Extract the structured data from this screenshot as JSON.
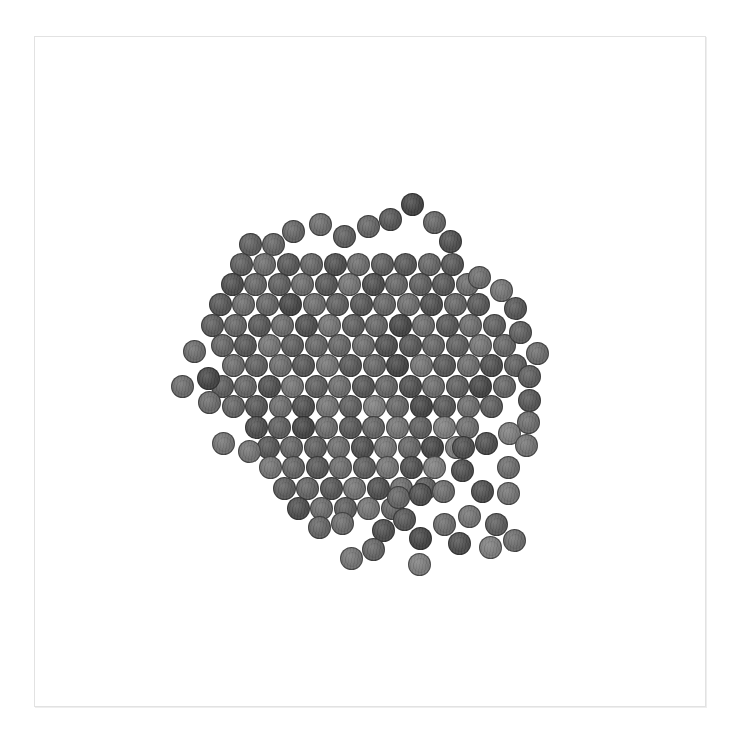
{
  "image": {
    "description": "Overhead grayscale photo of a pile of pennies arranged in a roughly hexagonal close-packed cluster with one empty spot near the center, scattered loose coins around the lower-right edge, on a white background inside a thin light-gray frame",
    "background_color": "#ffffff",
    "frame_color": "#e2e2e2"
  },
  "coin": {
    "diameter": 23,
    "spacing_x": 23.5,
    "spacing_y": 20.4
  },
  "palette": [
    "#3a3a3a",
    "#444444",
    "#4d4d4d",
    "#555555",
    "#5c5c5c",
    "#636363",
    "#6a6a6a",
    "#727272",
    "#7b7b7b",
    "#858585"
  ],
  "rows": [
    {
      "y": 244,
      "x0": 250,
      "n": 2,
      "shades": "45"
    },
    {
      "y": 264,
      "x0": 241,
      "n": 10,
      "shades": "4635264353"
    },
    {
      "y": 284,
      "x0": 232,
      "n": 11,
      "shades": "25463725436"
    },
    {
      "y": 304,
      "x0": 220,
      "n": 12,
      "shades": "365164356253"
    },
    {
      "y": 325,
      "x0": 212,
      "n": 13,
      "shades": "4536274516364"
    },
    {
      "y": 345,
      "x0": 222,
      "n": 13,
      "shades": "5374556235475"
    },
    {
      "y": 365,
      "x0": 233,
      "n": 13,
      "shades": "6463735173624"
    },
    {
      "y": 386,
      "x0": 222,
      "n": 13,
      "shades": "4527463526415"
    },
    {
      "y": 406,
      "x0": 233,
      "n": 12,
      "shades": "536274851364"
    },
    {
      "y": 427,
      "x0": 256,
      "n": 10,
      "shades": "2416357486"
    },
    {
      "y": 447,
      "x0": 268,
      "n": 9,
      "shades": "354627518"
    },
    {
      "y": 467,
      "x0": 270,
      "n": 8,
      "shades": "75364728"
    },
    {
      "y": 488,
      "x0": 284,
      "n": 7,
      "shades": "4537264"
    },
    {
      "y": 508,
      "x0": 298,
      "n": 5,
      "shades": "26475"
    }
  ],
  "hole": {
    "x": 350,
    "y": 356
  },
  "loose_coins": [
    {
      "x": 412,
      "y": 204,
      "s": 1
    },
    {
      "x": 293,
      "y": 231,
      "s": 5
    },
    {
      "x": 320,
      "y": 224,
      "s": 6
    },
    {
      "x": 344,
      "y": 236,
      "s": 4
    },
    {
      "x": 368,
      "y": 226,
      "s": 5
    },
    {
      "x": 390,
      "y": 219,
      "s": 3
    },
    {
      "x": 434,
      "y": 222,
      "s": 5
    },
    {
      "x": 450,
      "y": 241,
      "s": 2
    },
    {
      "x": 479,
      "y": 277,
      "s": 6
    },
    {
      "x": 501,
      "y": 290,
      "s": 7
    },
    {
      "x": 515,
      "y": 308,
      "s": 3
    },
    {
      "x": 520,
      "y": 332,
      "s": 4
    },
    {
      "x": 537,
      "y": 353,
      "s": 6
    },
    {
      "x": 529,
      "y": 376,
      "s": 4
    },
    {
      "x": 529,
      "y": 400,
      "s": 3
    },
    {
      "x": 528,
      "y": 422,
      "s": 6
    },
    {
      "x": 509,
      "y": 433,
      "s": 8
    },
    {
      "x": 526,
      "y": 445,
      "s": 7
    },
    {
      "x": 194,
      "y": 351,
      "s": 6
    },
    {
      "x": 182,
      "y": 386,
      "s": 6
    },
    {
      "x": 208,
      "y": 378,
      "s": 1
    },
    {
      "x": 209,
      "y": 402,
      "s": 6
    },
    {
      "x": 223,
      "y": 443,
      "s": 7
    },
    {
      "x": 249,
      "y": 451,
      "s": 7
    },
    {
      "x": 486,
      "y": 443,
      "s": 2
    },
    {
      "x": 463,
      "y": 447,
      "s": 2
    },
    {
      "x": 462,
      "y": 470,
      "s": 2
    },
    {
      "x": 508,
      "y": 467,
      "s": 6
    },
    {
      "x": 443,
      "y": 491,
      "s": 6
    },
    {
      "x": 482,
      "y": 491,
      "s": 2
    },
    {
      "x": 508,
      "y": 493,
      "s": 7
    },
    {
      "x": 420,
      "y": 494,
      "s": 2
    },
    {
      "x": 398,
      "y": 497,
      "s": 5
    },
    {
      "x": 404,
      "y": 519,
      "s": 3
    },
    {
      "x": 383,
      "y": 530,
      "s": 2
    },
    {
      "x": 444,
      "y": 524,
      "s": 6
    },
    {
      "x": 469,
      "y": 516,
      "s": 7
    },
    {
      "x": 496,
      "y": 524,
      "s": 4
    },
    {
      "x": 420,
      "y": 538,
      "s": 1
    },
    {
      "x": 459,
      "y": 543,
      "s": 2
    },
    {
      "x": 490,
      "y": 547,
      "s": 8
    },
    {
      "x": 514,
      "y": 540,
      "s": 6
    },
    {
      "x": 373,
      "y": 549,
      "s": 5
    },
    {
      "x": 351,
      "y": 558,
      "s": 7
    },
    {
      "x": 419,
      "y": 564,
      "s": 8
    },
    {
      "x": 319,
      "y": 527,
      "s": 5
    },
    {
      "x": 342,
      "y": 523,
      "s": 6
    }
  ]
}
